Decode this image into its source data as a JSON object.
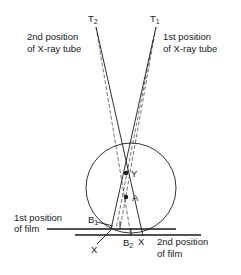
{
  "diagram": {
    "labels": {
      "t2": "T",
      "t2_sub": "2",
      "t1": "T",
      "t1_sub": "1",
      "tube_pos2_line1": "2nd position",
      "tube_pos2_line2": "of X-ray tube",
      "tube_pos1_line1": "1st position",
      "tube_pos1_line2": "of X-ray tube",
      "point_y": "Y",
      "point_a": "A",
      "b1": "B",
      "b1_sub": "1",
      "b2": "B",
      "b2_sub": "2",
      "x_left": "X",
      "x_right": "X",
      "film_pos1_line1": "1st position",
      "film_pos1_line2": "of film",
      "film_pos2_line1": "2nd position",
      "film_pos2_line2": "of film"
    },
    "colors": {
      "ink": "#1a1a1a",
      "background": "#ffffff"
    }
  }
}
